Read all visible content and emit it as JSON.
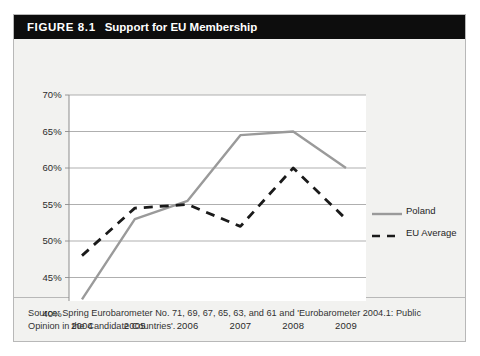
{
  "figure": {
    "number": "FIGURE 8.1",
    "title": "Support for EU Membership",
    "source": "Source: Spring Eurobarometer No. 71, 69, 67, 65, 63, and 61 and 'Eurobarometer 2004.1: Public Opinion in the Candidate Countries'."
  },
  "colors": {
    "poland_line": "#9a9a9a",
    "eu_line": "#1a1a1a",
    "grid": "#a6a6a6",
    "axis": "#8c8c8c",
    "title_bar": "#0d0d0d",
    "panel_bg": "#f2f2f0",
    "plot_bg": "#ffffff"
  },
  "chart_data": {
    "type": "line",
    "title": "Support for EU Membership",
    "xlabel": "",
    "ylabel": "",
    "x": [
      "2004",
      "2005",
      "2006",
      "2007",
      "2008",
      "2009"
    ],
    "categories": [
      "2004",
      "2005",
      "2006",
      "2007",
      "2008",
      "2009"
    ],
    "ylim": [
      40,
      70
    ],
    "yticks": [
      40,
      45,
      50,
      55,
      60,
      65,
      70
    ],
    "ytick_labels": [
      "40%",
      "45%",
      "50%",
      "55%",
      "60%",
      "65%",
      "70%"
    ],
    "grid": true,
    "legend_position": "right",
    "series": [
      {
        "name": "Poland",
        "style": "solid",
        "color": "#9a9a9a",
        "values": [
          42,
          53,
          55.5,
          64.5,
          65,
          60
        ]
      },
      {
        "name": "EU Average",
        "style": "dashed",
        "color": "#1a1a1a",
        "values": [
          48,
          54.5,
          55,
          52,
          60,
          53
        ]
      }
    ]
  }
}
